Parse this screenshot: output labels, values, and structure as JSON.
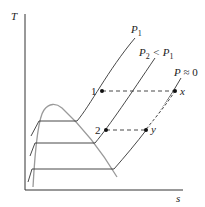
{
  "diagram": {
    "type": "T-s diagram (isobars and saturation dome)",
    "axes": {
      "y_label": "T",
      "x_label": "s"
    },
    "isobars": [
      {
        "label_main": "P",
        "label_sub": "1",
        "label_rest": ""
      },
      {
        "label_main": "P",
        "label_sub": "2",
        "label_rest": " < P",
        "label_sub2": "1"
      },
      {
        "label_main": "P",
        "label_rest": " ≈ 0"
      }
    ],
    "points": [
      {
        "id": "1",
        "label": "1"
      },
      {
        "id": "2",
        "label": "2"
      },
      {
        "id": "x",
        "label": "x"
      },
      {
        "id": "y",
        "label": "y"
      }
    ],
    "colors": {
      "axis": "#333333",
      "isobar": "#333333",
      "dome": "#9a9a9a",
      "dashed": "#333333",
      "point": "#111111"
    }
  }
}
